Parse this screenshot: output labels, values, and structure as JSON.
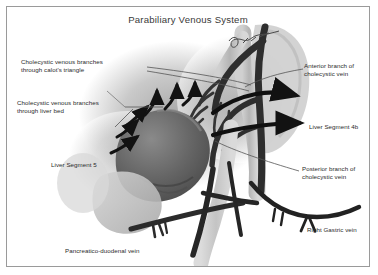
{
  "figure": {
    "title": "Parabiliary  Venous System",
    "type": "medical-anatomical-illustration",
    "modality": "grayscale-photograph-of-anatomic-model",
    "signature_mark": "handwritten-signature-scribble"
  },
  "labels": [
    {
      "id": "calots",
      "text": "Cholecystic venous branches\nthrough calot's triangle",
      "x": 14,
      "y": 51,
      "align": "left"
    },
    {
      "id": "liverbed",
      "text": "Cholecystic venous branches\nthrough liver bed",
      "x": 10,
      "y": 92,
      "align": "left"
    },
    {
      "id": "seg5",
      "text": "Liver Segment 5",
      "x": 44,
      "y": 154,
      "align": "left"
    },
    {
      "id": "pdvein",
      "text": "Pancreatico-duodenal vein",
      "x": 58,
      "y": 240,
      "align": "left"
    },
    {
      "id": "cbd",
      "text": "Common Bile Duct",
      "x": 205,
      "y": 261,
      "align": "left"
    },
    {
      "id": "anterior",
      "text": "Anterior branch of\ncholecystic vein",
      "x": 297,
      "y": 55,
      "align": "left"
    },
    {
      "id": "seg4b",
      "text": "Liver Segment 4b",
      "x": 302,
      "y": 116,
      "align": "left"
    },
    {
      "id": "posterior",
      "text": "Posterior branch of\ncholecystic vein",
      "x": 295,
      "y": 158,
      "align": "left"
    },
    {
      "id": "rgvein",
      "text": "Right Gastric vein",
      "x": 300,
      "y": 219,
      "align": "left"
    }
  ],
  "colors": {
    "background": "#ffffff",
    "frame_border": "#9a9a9a",
    "text": "#2b2b2b",
    "title_text": "#3a3a3a",
    "vessel_dark": "#2e2e2e",
    "vessel_mid": "#4a4a4a",
    "gallbladder": "#6d6d6d",
    "liver_tissue": "#b8b8b8",
    "bile_duct": "#c9c9c9",
    "arrow_black": "#121212",
    "leader_line": "#555555"
  }
}
